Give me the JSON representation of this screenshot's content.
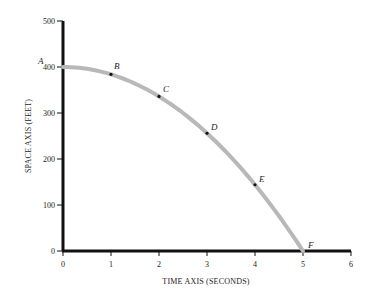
{
  "chart_data": {
    "type": "line",
    "title": "",
    "xlabel": "TIME AXIS   (SECONDS)",
    "ylabel": "SPACE AXIS (FEET)",
    "xlim": [
      0,
      6
    ],
    "ylim": [
      0,
      500
    ],
    "x_ticks": [
      "0",
      "1",
      "2",
      "3",
      "4",
      "5",
      "6"
    ],
    "y_ticks": [
      "0",
      "100",
      "200",
      "300",
      "400",
      "500"
    ],
    "grid": false,
    "legend": null,
    "series": [
      {
        "name": "position",
        "x": [
          0,
          1,
          2,
          3,
          4,
          5
        ],
        "values": [
          400,
          384,
          336,
          256,
          144,
          0
        ],
        "point_labels": [
          "A",
          "B",
          "C",
          "D",
          "E",
          "F"
        ],
        "color": "#b8b8b8"
      }
    ]
  }
}
